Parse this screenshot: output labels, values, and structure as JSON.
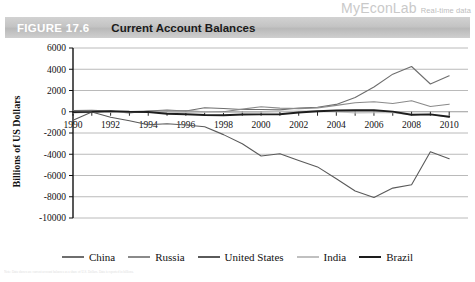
{
  "brand": {
    "name": "MyEconLab",
    "tagline": "Real-time data"
  },
  "header": {
    "figure_label": "FIGURE 17.6",
    "title": "Current Account Balances",
    "band_color": "#c4c4c4"
  },
  "caption": {
    "text": "Note: Data shown are current account balances as a share of U.S. Dollars. Data is reported in billions."
  },
  "chart_data": {
    "type": "line",
    "title": "Current Account Balances",
    "xlabel": "",
    "ylabel": "Billions of US Dollars",
    "xlim": [
      1990,
      2011
    ],
    "ylim": [
      -10000,
      6000
    ],
    "ytick_step": 2000,
    "grid": true,
    "legend_position": "bottom",
    "yticks": [
      "6000",
      "4000",
      "2000",
      "0",
      "-2000",
      "-4000",
      "-6000",
      "-8000",
      "-10000"
    ],
    "ytick_values": [
      6000,
      4000,
      2000,
      0,
      -2000,
      -4000,
      -6000,
      -8000,
      -10000
    ],
    "xticks": [
      "1990",
      "1992",
      "1994",
      "1996",
      "1998",
      "2000",
      "2002",
      "2004",
      "2006",
      "2008",
      "2010"
    ],
    "xtick_values": [
      1990,
      1992,
      1994,
      1996,
      1998,
      2000,
      2002,
      2004,
      2006,
      2008,
      2010
    ],
    "x": [
      1990,
      1991,
      1992,
      1993,
      1994,
      1995,
      1996,
      1997,
      1998,
      1999,
      2000,
      2001,
      2002,
      2003,
      2004,
      2005,
      2006,
      2007,
      2008,
      2009,
      2010
    ],
    "series": [
      {
        "name": "China",
        "color": "#6e6e6e",
        "width": 1.1,
        "values": [
          120,
          130,
          60,
          -120,
          70,
          160,
          70,
          370,
          310,
          210,
          205,
          174,
          354,
          430,
          690,
          1341,
          2327,
          3540,
          4261,
          2611,
          3378
        ]
      },
      {
        "name": "Russia",
        "color": "#8a8a8a",
        "width": 1.1,
        "values": [
          -80,
          -60,
          -30,
          10,
          70,
          70,
          110,
          -10,
          2,
          249,
          467,
          337,
          294,
          353,
          598,
          843,
          945,
          772,
          1035,
          487,
          713
        ]
      },
      {
        "name": "United States",
        "color": "#5a5a5a",
        "width": 1.1,
        "values": [
          -790,
          -30,
          -510,
          -850,
          -1220,
          -1136,
          -1246,
          -1405,
          -2153,
          -3010,
          -4170,
          -3947,
          -4586,
          -5191,
          -6299,
          -7455,
          -8067,
          -7187,
          -6868,
          -3768,
          -4420
        ]
      },
      {
        "name": "India",
        "color": "#c0c0c0",
        "width": 1.1,
        "values": [
          -98,
          -17,
          -36,
          -12,
          -19,
          -58,
          -58,
          -29,
          -69,
          -47,
          -46,
          32,
          70,
          84,
          7,
          -103,
          -96,
          -80,
          -307,
          -259,
          -520
        ]
      },
      {
        "name": "Brazil",
        "color": "#1d1d1d",
        "width": 1.9,
        "values": [
          -38,
          -14,
          62,
          -6,
          -17,
          -184,
          -232,
          -305,
          -334,
          -252,
          -243,
          -234,
          -77,
          41,
          118,
          140,
          136,
          15,
          -283,
          -243,
          -472
        ]
      }
    ]
  }
}
